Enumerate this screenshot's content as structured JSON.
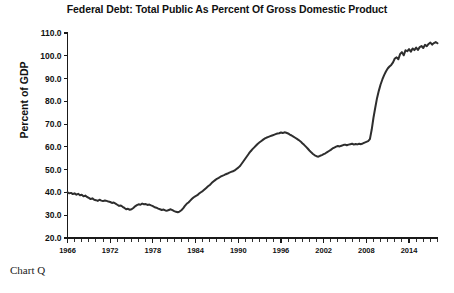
{
  "chart_data": {
    "type": "line",
    "title": "Federal Debt: Total Public As Percent Of Gross Domestic Product",
    "xlabel": "",
    "ylabel": "Percent of GDP",
    "ylim": [
      20.0,
      110.0
    ],
    "xlim": [
      1966,
      2018
    ],
    "ytick_labels": [
      "110.0",
      "100.0",
      "90.0",
      "80.0",
      "70.0",
      "60.0",
      "50.0",
      "40.0",
      "30.0",
      "20.0"
    ],
    "ytick_values": [
      110.0,
      100.0,
      90.0,
      80.0,
      70.0,
      60.0,
      50.0,
      40.0,
      30.0,
      20.0
    ],
    "xtick_labels": [
      "1966",
      "1972",
      "1978",
      "1984",
      "1990",
      "1996",
      "2002",
      "2008",
      "2014"
    ],
    "xtick_values": [
      1966,
      1972,
      1978,
      1984,
      1990,
      1996,
      2002,
      2008,
      2014
    ],
    "grid": false,
    "legend": false,
    "line_color": "#2e2e2e",
    "background_color": "#ffffff",
    "series": [
      {
        "name": "Federal Debt: Total Public as Percent of GDP",
        "x": [
          1966.0,
          1966.25,
          1966.5,
          1966.75,
          1967.0,
          1967.25,
          1967.5,
          1967.75,
          1968.0,
          1968.25,
          1968.5,
          1968.75,
          1969.0,
          1969.25,
          1969.5,
          1969.75,
          1970.0,
          1970.25,
          1970.5,
          1970.75,
          1971.0,
          1971.25,
          1971.5,
          1971.75,
          1972.0,
          1972.25,
          1972.5,
          1972.75,
          1973.0,
          1973.25,
          1973.5,
          1973.75,
          1974.0,
          1974.25,
          1974.5,
          1974.75,
          1975.0,
          1975.25,
          1975.5,
          1975.75,
          1976.0,
          1976.25,
          1976.5,
          1976.75,
          1977.0,
          1977.25,
          1977.5,
          1977.75,
          1978.0,
          1978.25,
          1978.5,
          1978.75,
          1979.0,
          1979.25,
          1979.5,
          1979.75,
          1980.0,
          1980.25,
          1980.5,
          1980.75,
          1981.0,
          1981.25,
          1981.5,
          1981.75,
          1982.0,
          1982.25,
          1982.5,
          1982.75,
          1983.0,
          1983.25,
          1983.5,
          1983.75,
          1984.0,
          1984.25,
          1984.5,
          1984.75,
          1985.0,
          1985.25,
          1985.5,
          1985.75,
          1986.0,
          1986.25,
          1986.5,
          1986.75,
          1987.0,
          1987.25,
          1987.5,
          1987.75,
          1988.0,
          1988.25,
          1988.5,
          1988.75,
          1989.0,
          1989.25,
          1989.5,
          1989.75,
          1990.0,
          1990.25,
          1990.5,
          1990.75,
          1991.0,
          1991.25,
          1991.5,
          1991.75,
          1992.0,
          1992.25,
          1992.5,
          1992.75,
          1993.0,
          1993.25,
          1993.5,
          1993.75,
          1994.0,
          1994.25,
          1994.5,
          1994.75,
          1995.0,
          1995.25,
          1995.5,
          1995.75,
          1996.0,
          1996.25,
          1996.5,
          1996.75,
          1997.0,
          1997.25,
          1997.5,
          1997.75,
          1998.0,
          1998.25,
          1998.5,
          1998.75,
          1999.0,
          1999.25,
          1999.5,
          1999.75,
          2000.0,
          2000.25,
          2000.5,
          2000.75,
          2001.0,
          2001.25,
          2001.5,
          2001.75,
          2002.0,
          2002.25,
          2002.5,
          2002.75,
          2003.0,
          2003.25,
          2003.5,
          2003.75,
          2004.0,
          2004.25,
          2004.5,
          2004.75,
          2005.0,
          2005.25,
          2005.5,
          2005.75,
          2006.0,
          2006.25,
          2006.5,
          2006.75,
          2007.0,
          2007.25,
          2007.5,
          2007.75,
          2008.0,
          2008.25,
          2008.5,
          2008.75,
          2009.0,
          2009.25,
          2009.5,
          2009.75,
          2010.0,
          2010.25,
          2010.5,
          2010.75,
          2011.0,
          2011.25,
          2011.5,
          2011.75,
          2012.0,
          2012.25,
          2012.5,
          2012.75,
          2013.0,
          2013.25,
          2013.5,
          2013.75,
          2014.0,
          2014.25,
          2014.5,
          2014.75,
          2015.0,
          2015.25,
          2015.5,
          2015.75,
          2016.0,
          2016.25,
          2016.5,
          2016.75,
          2017.0,
          2017.25,
          2017.5,
          2017.75,
          2018.0
        ],
        "values": [
          40.1,
          39.6,
          39.8,
          39.3,
          39.6,
          39.0,
          39.4,
          38.8,
          39.0,
          38.3,
          38.6,
          38.0,
          37.6,
          37.1,
          37.4,
          36.8,
          36.6,
          36.3,
          36.8,
          36.4,
          36.2,
          36.5,
          36.3,
          36.0,
          35.8,
          35.4,
          35.6,
          35.1,
          34.6,
          34.1,
          34.3,
          33.7,
          33.2,
          32.6,
          32.8,
          32.4,
          32.6,
          33.2,
          33.9,
          34.4,
          34.8,
          34.6,
          35.1,
          34.8,
          34.9,
          34.5,
          34.7,
          34.3,
          34.0,
          33.5,
          33.3,
          32.9,
          32.6,
          32.3,
          32.5,
          32.1,
          32.0,
          32.3,
          32.6,
          32.2,
          31.8,
          31.5,
          31.3,
          31.6,
          32.2,
          33.0,
          34.1,
          35.0,
          35.6,
          36.4,
          37.2,
          37.9,
          38.4,
          38.8,
          39.5,
          40.1,
          40.6,
          41.3,
          42.0,
          42.7,
          43.3,
          44.1,
          44.8,
          45.4,
          46.0,
          46.4,
          46.9,
          47.3,
          47.6,
          48.0,
          48.3,
          48.7,
          49.0,
          49.3,
          49.7,
          50.3,
          50.9,
          51.6,
          52.7,
          53.8,
          54.9,
          56.0,
          57.1,
          58.1,
          59.0,
          59.8,
          60.6,
          61.4,
          62.0,
          62.6,
          63.2,
          63.7,
          64.1,
          64.4,
          64.7,
          65.0,
          65.3,
          65.6,
          65.9,
          66.0,
          66.3,
          66.1,
          66.4,
          66.2,
          65.9,
          65.4,
          65.0,
          64.5,
          64.0,
          63.5,
          63.0,
          62.4,
          61.6,
          60.9,
          60.1,
          59.3,
          58.4,
          57.6,
          56.9,
          56.3,
          55.9,
          55.7,
          56.1,
          56.4,
          56.8,
          57.2,
          57.7,
          58.2,
          58.7,
          59.3,
          59.7,
          60.1,
          60.4,
          60.2,
          60.5,
          60.8,
          61.0,
          60.7,
          61.0,
          61.2,
          61.4,
          61.0,
          61.3,
          61.1,
          61.4,
          61.2,
          61.5,
          61.9,
          62.2,
          62.5,
          63.4,
          67.5,
          72.8,
          77.2,
          81.4,
          84.6,
          87.4,
          89.6,
          91.5,
          93.1,
          94.4,
          95.3,
          96.0,
          97.1,
          98.8,
          99.3,
          98.5,
          100.8,
          101.6,
          100.2,
          102.4,
          102.0,
          102.9,
          101.8,
          103.2,
          102.5,
          103.6,
          102.6,
          103.8,
          104.3,
          103.4,
          104.8,
          104.2,
          105.2,
          105.8,
          104.9,
          105.6,
          106.0,
          105.5
        ]
      }
    ],
    "caption": "Chart Q",
    "notes": {
      "start_value": 40.1,
      "minimum": 31.3,
      "minimum_year": 1981,
      "mid_peak": 66.4,
      "mid_peak_year": 1996,
      "local_trough": 55.7,
      "local_trough_year": 2001,
      "end_value": 105.5
    }
  },
  "caption": {
    "text": "Chart Q"
  }
}
